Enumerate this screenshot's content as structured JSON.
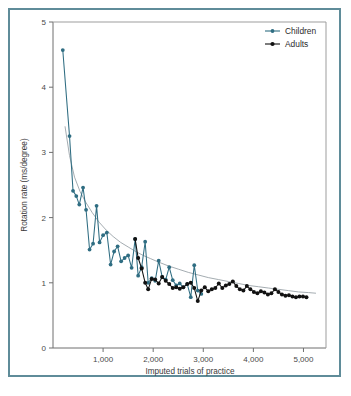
{
  "figure": {
    "border_color": "#5f8c99",
    "background": "#ffffff"
  },
  "legend": {
    "position": "top-right",
    "entries": [
      {
        "label": "Children",
        "color": "#2f6d82",
        "marker": "circle"
      },
      {
        "label": "Adults",
        "color": "#111111",
        "marker": "circle"
      }
    ]
  },
  "axes": {
    "x": {
      "label": "Imputed trials of practice",
      "ticks": [
        0,
        1000,
        2000,
        3000,
        4000,
        5000
      ],
      "tick_labels": [
        "",
        "1,000",
        "2,000",
        "3,000",
        "4,000",
        "5,000"
      ],
      "min": 0,
      "max": 5450
    },
    "y": {
      "label": "Rotation rate (ms/degree)",
      "ticks": [
        0,
        1,
        2,
        3,
        4,
        5
      ],
      "tick_labels": [
        "0",
        "1",
        "2",
        "3",
        "4",
        "5"
      ],
      "min": 0,
      "max": 5
    }
  },
  "chart_data": {
    "type": "line",
    "title": "",
    "xlabel": "Imputed trials of practice",
    "ylabel": "Rotation rate (ms/degree)",
    "xlim": [
      0,
      5450
    ],
    "ylim": [
      0,
      5
    ],
    "grid": false,
    "legend_position": "top-right",
    "series": [
      {
        "name": "Children",
        "color": "#2f6d82",
        "marker": "circle",
        "points": [
          [
            195,
            4.57
          ],
          [
            330,
            3.25
          ],
          [
            400,
            2.41
          ],
          [
            465,
            2.33
          ],
          [
            525,
            2.2
          ],
          [
            600,
            2.46
          ],
          [
            660,
            2.12
          ],
          [
            730,
            1.51
          ],
          [
            800,
            1.6
          ],
          [
            870,
            2.18
          ],
          [
            930,
            1.62
          ],
          [
            1000,
            1.73
          ],
          [
            1075,
            1.77
          ],
          [
            1150,
            1.28
          ],
          [
            1220,
            1.48
          ],
          [
            1290,
            1.56
          ],
          [
            1360,
            1.33
          ],
          [
            1430,
            1.38
          ],
          [
            1500,
            1.42
          ],
          [
            1570,
            1.23
          ],
          [
            1640,
            1.67
          ],
          [
            1700,
            1.11
          ],
          [
            1770,
            1.24
          ],
          [
            1840,
            1.63
          ],
          [
            1900,
            1.0
          ],
          [
            1970,
            1.07
          ],
          [
            2040,
            1.03
          ],
          [
            2110,
            1.34
          ],
          [
            2180,
            1.09
          ],
          [
            2250,
            1.05
          ],
          [
            2320,
            1.24
          ],
          [
            2390,
            1.04
          ],
          [
            2460,
            0.96
          ],
          [
            2530,
            0.99
          ],
          [
            2600,
            0.93
          ],
          [
            2680,
            0.98
          ],
          [
            2750,
            0.78
          ],
          [
            2820,
            1.27
          ],
          [
            2890,
            0.88
          ],
          [
            2960,
            0.83
          ]
        ]
      },
      {
        "name": "Adults",
        "color": "#111111",
        "marker": "circle",
        "points": [
          [
            1640,
            1.67
          ],
          [
            1700,
            1.38
          ],
          [
            1770,
            1.22
          ],
          [
            1840,
            1.0
          ],
          [
            1900,
            0.9
          ],
          [
            1970,
            1.06
          ],
          [
            2040,
            1.05
          ],
          [
            2110,
            0.99
          ],
          [
            2180,
            1.09
          ],
          [
            2250,
            1.03
          ],
          [
            2320,
            0.98
          ],
          [
            2390,
            0.92
          ],
          [
            2460,
            0.93
          ],
          [
            2530,
            0.91
          ],
          [
            2600,
            0.93
          ],
          [
            2680,
            0.98
          ],
          [
            2750,
            1.0
          ],
          [
            2820,
            0.92
          ],
          [
            2890,
            0.72
          ],
          [
            2960,
            0.88
          ],
          [
            3030,
            0.93
          ],
          [
            3100,
            0.87
          ],
          [
            3170,
            0.9
          ],
          [
            3240,
            0.92
          ],
          [
            3310,
            0.99
          ],
          [
            3380,
            0.92
          ],
          [
            3450,
            0.96
          ],
          [
            3520,
            0.98
          ],
          [
            3590,
            1.02
          ],
          [
            3660,
            0.95
          ],
          [
            3730,
            0.9
          ],
          [
            3800,
            0.88
          ],
          [
            3870,
            0.95
          ],
          [
            3940,
            0.9
          ],
          [
            4010,
            0.86
          ],
          [
            4080,
            0.84
          ],
          [
            4150,
            0.87
          ],
          [
            4220,
            0.85
          ],
          [
            4290,
            0.82
          ],
          [
            4360,
            0.84
          ],
          [
            4430,
            0.9
          ],
          [
            4500,
            0.86
          ],
          [
            4570,
            0.82
          ],
          [
            4640,
            0.8
          ],
          [
            4710,
            0.81
          ],
          [
            4780,
            0.79
          ],
          [
            4850,
            0.78
          ],
          [
            4920,
            0.79
          ],
          [
            4990,
            0.79
          ],
          [
            5060,
            0.78
          ]
        ]
      }
    ],
    "trend_curve": {
      "name": "power-law fit",
      "color": "#9aa3a8",
      "points": [
        [
          240,
          3.4
        ],
        [
          330,
          2.95
        ],
        [
          430,
          2.62
        ],
        [
          540,
          2.4
        ],
        [
          650,
          2.24
        ],
        [
          780,
          2.08
        ],
        [
          920,
          1.93
        ],
        [
          1060,
          1.81
        ],
        [
          1200,
          1.71
        ],
        [
          1350,
          1.62
        ],
        [
          1500,
          1.55
        ],
        [
          1650,
          1.48
        ],
        [
          1800,
          1.42
        ],
        [
          1950,
          1.37
        ],
        [
          2100,
          1.32
        ],
        [
          2300,
          1.26
        ],
        [
          2500,
          1.21
        ],
        [
          2700,
          1.16
        ],
        [
          2900,
          1.12
        ],
        [
          3100,
          1.08
        ],
        [
          3300,
          1.05
        ],
        [
          3500,
          1.02
        ],
        [
          3700,
          0.99
        ],
        [
          3900,
          0.96
        ],
        [
          4100,
          0.94
        ],
        [
          4300,
          0.92
        ],
        [
          4500,
          0.9
        ],
        [
          4700,
          0.88
        ],
        [
          4900,
          0.86
        ],
        [
          5100,
          0.85
        ],
        [
          5250,
          0.84
        ]
      ]
    }
  }
}
